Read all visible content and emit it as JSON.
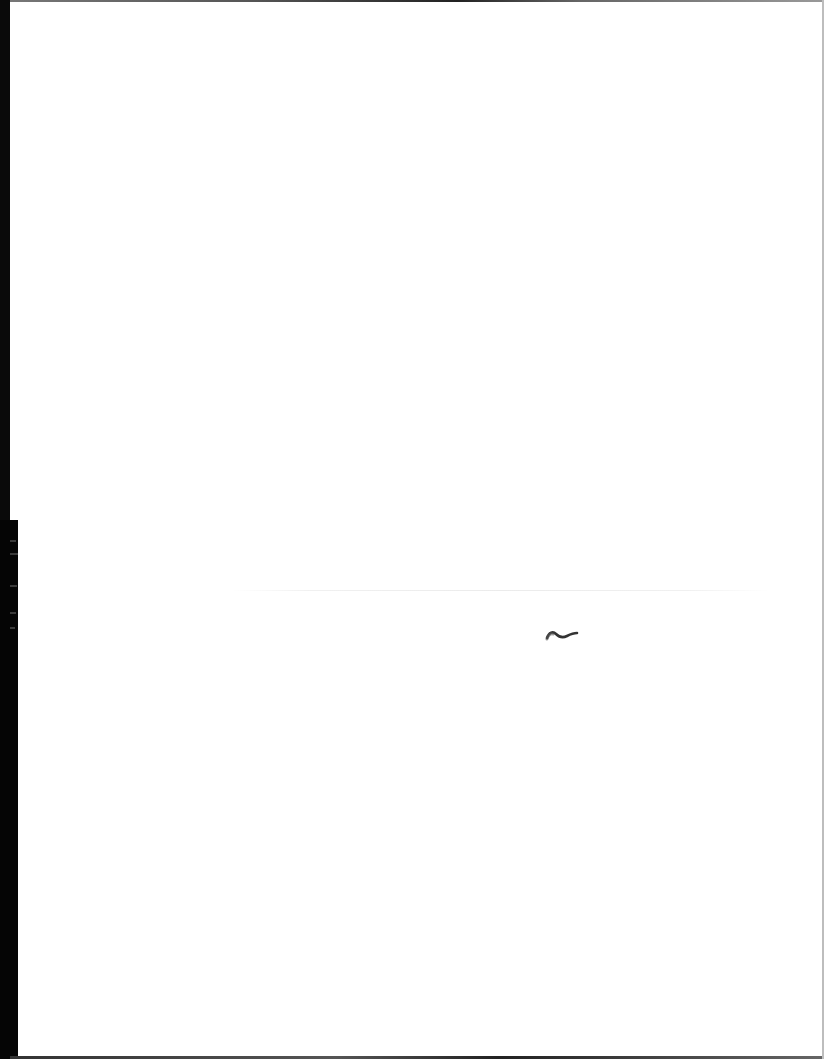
{
  "document": {
    "type": "scanned-page",
    "content": "",
    "marks": [
      {
        "kind": "ink-squiggle",
        "glyph": "~"
      }
    ]
  },
  "colors": {
    "paper": "#ffffff",
    "scanner_edge": "#0a0a0a",
    "ink": "#333333"
  }
}
